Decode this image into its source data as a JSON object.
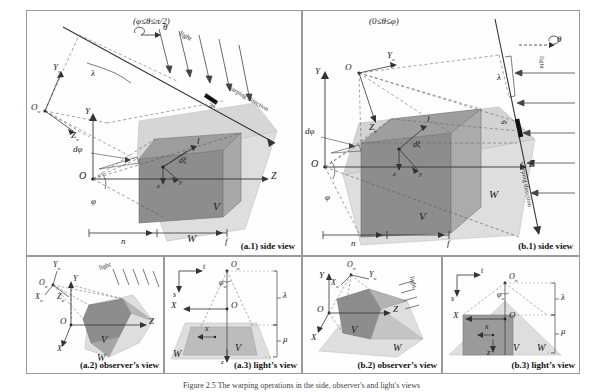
{
  "figure": {
    "caption": "Figure 2.5  The warping operations in the side, observer's and light's views",
    "panels": [
      {
        "id": "a1",
        "caption": "(a.1) side view",
        "condition": "(φ≤θ≤π/2)",
        "labels": {
          "theta_rot": "θ",
          "light": "light",
          "warping": "warping direction",
          "lambda": "λ",
          "ds": "ds",
          "origin_w": "O",
          "origin_w_sub": "w",
          "axis_Yw": "Y",
          "axis_Yw_sub": "w",
          "axis_Zw": "Z",
          "axis_Zw_sub": "w",
          "origin": "O",
          "axis_Y": "Y",
          "axis_Z": "Z",
          "dphi": "dφ",
          "dxi": "dξ",
          "phi": "φ",
          "vec_l": "l",
          "small_z": "z",
          "small_y": "y",
          "frustum_V": "V",
          "frustum_W": "W",
          "near": "n",
          "far": "f"
        }
      },
      {
        "id": "b1",
        "caption": "(b.1) side view",
        "condition": "(0≤θ≤φ)",
        "labels": {
          "theta_rot": "θ",
          "light": "light",
          "warping": "warping direction",
          "lambda": "λ",
          "ds": "ds",
          "origin_w": "O",
          "origin_w_sub": "w",
          "axis_Yw": "Y",
          "axis_Yw_sub": "w",
          "axis_Zw": "Z",
          "axis_Zw_sub": "w",
          "origin": "O",
          "axis_Y": "Y",
          "axis_Z": "Z",
          "dphi": "dφ",
          "dxi": "dξ",
          "phi": "φ",
          "vec_l": "l",
          "small_z": "z",
          "small_y": "y",
          "frustum_V": "V",
          "frustum_W": "W",
          "near": "n",
          "far": "f"
        }
      },
      {
        "id": "a2",
        "caption": "(a.2) observer’s view",
        "labels": {
          "light": "light",
          "origin_w": "O",
          "origin_w_sub": "w",
          "axis_Xw": "X",
          "axis_Xw_sub": "w",
          "axis_Yw": "Y",
          "axis_Yw_sub": "w",
          "axis_Zw": "Z",
          "axis_Zw_sub": "w",
          "origin": "O",
          "axis_X": "X",
          "axis_Y": "Y",
          "axis_Z": "Z",
          "frustum_V": "V",
          "frustum_W": "W"
        }
      },
      {
        "id": "a3",
        "caption": "(a.3) light’s view",
        "labels": {
          "axis_s": "s",
          "axis_t": "t",
          "origin_w": "O",
          "origin_w_sub": "w",
          "phi_w": "φ",
          "phi_w_sub": "w",
          "origin": "O",
          "axis_X": "X",
          "small_x": "x",
          "small_z": "z",
          "lambda": "λ",
          "mu": "μ",
          "frustum_V": "V",
          "frustum_W": "W"
        }
      },
      {
        "id": "b2",
        "caption": "(b.2) observer’s view",
        "labels": {
          "light": "light",
          "origin_w": "O",
          "origin_w_sub": "w",
          "axis_Xw": "X",
          "axis_Xw_sub": "w",
          "axis_Yw": "Y",
          "axis_Yw_sub": "w",
          "axis_Zw": "Z",
          "axis_Zw_sub": "w",
          "origin": "O",
          "axis_X": "X",
          "axis_Y": "Y",
          "axis_Z": "Z",
          "frustum_V": "V",
          "frustum_W": "W"
        }
      },
      {
        "id": "b3",
        "caption": "(b.3) light’s view",
        "labels": {
          "axis_s": "s",
          "axis_t": "t",
          "origin_w": "O",
          "origin_w_sub": "w",
          "phi_w": "φ",
          "phi_w_sub": "w",
          "origin": "O",
          "axis_X": "X",
          "small_x": "x",
          "small_z": "z",
          "lambda": "λ",
          "mu": "μ",
          "frustum_V": "V",
          "frustum_W": "W"
        }
      }
    ]
  },
  "colors": {
    "frustum_dark": "#8d8d8d",
    "frustum_light": "#d4d4d4",
    "frustum_mid": "#bfbfbf",
    "line": "#333333",
    "dashed": "#555555",
    "border": "#9a9a9a"
  }
}
